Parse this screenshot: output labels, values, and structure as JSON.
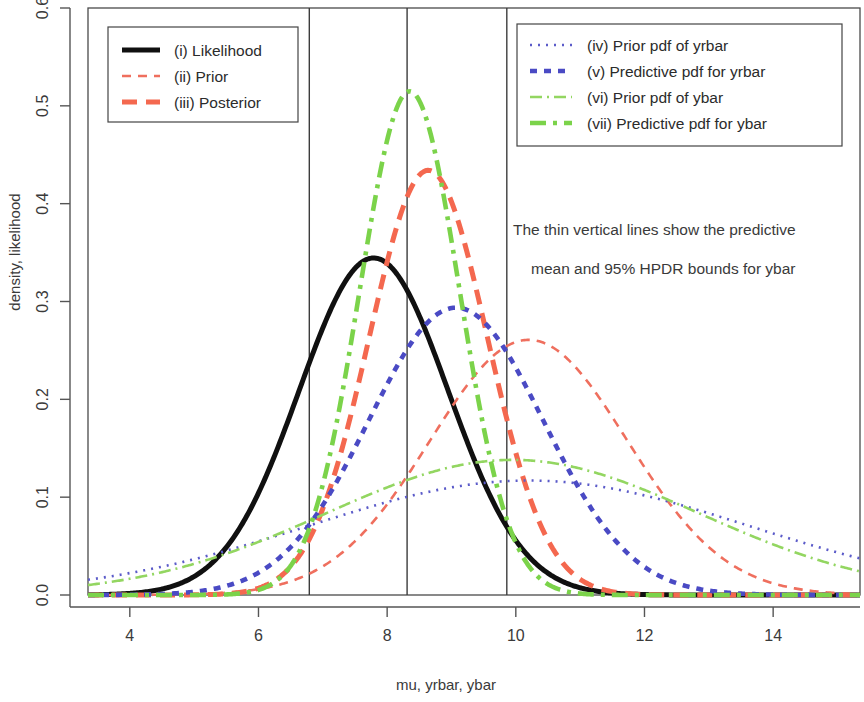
{
  "chart_data": {
    "type": "line",
    "title": "",
    "xlabel": "mu, yrbar, ybar",
    "ylabel": "density, likelihood",
    "xlim": [
      3.35,
      15.35
    ],
    "ylim": [
      0.0,
      0.6
    ],
    "xticks": [
      4,
      6,
      8,
      10,
      12,
      14
    ],
    "xtick_labels": [
      "4",
      "6",
      "8",
      "10",
      "12",
      "14"
    ],
    "yticks": [
      0.0,
      0.1,
      0.2,
      0.3,
      0.4,
      0.5,
      0.6
    ],
    "ytick_labels": [
      "0.0",
      "0.1",
      "0.2",
      "0.3",
      "0.4",
      "0.5",
      "0.6"
    ],
    "grid": false,
    "box": true,
    "annotations": [
      {
        "name": "hpdr-note",
        "lines": [
          "The thin vertical lines show the predictive",
          "mean and 95% HPDR bounds for ybar"
        ],
        "x": 11.6,
        "y": 0.245
      }
    ],
    "vertical_lines": {
      "label": "predictive mean and 95% HPDR bounds for ybar",
      "color": "#3c3c3c",
      "width": 1.4,
      "x_values": [
        6.79,
        8.31,
        9.86
      ]
    },
    "series": [
      {
        "key": "likelihood",
        "legend": "(i) Likelihood",
        "legend_group": "left",
        "color": "#101010",
        "width": 5.0,
        "dash": "none",
        "shape": "normal",
        "mean": 7.79,
        "sd": 1.158,
        "peak": 0.3445,
        "scale": 1.0
      },
      {
        "key": "prior",
        "legend": "(ii) Prior",
        "legend_group": "left",
        "color": "#ef6f5e",
        "width": 2.6,
        "dash": "9,7",
        "shape": "normal",
        "mean": 10.2,
        "sd": 1.53,
        "peak": 0.2608,
        "scale": 1.0
      },
      {
        "key": "posterior",
        "legend": "(iii) Posterior",
        "legend_group": "left",
        "color": "#f4684f",
        "width": 5.0,
        "dash": "15,9",
        "shape": "normal",
        "mean": 8.64,
        "sd": 0.919,
        "peak": 0.4341,
        "scale": 1.0
      },
      {
        "key": "prior-pdf-yrbar",
        "legend": "(iv) Prior pdf of yrbar",
        "legend_group": "right",
        "color": "#5b5bc9",
        "width": 2.6,
        "dash": "2,6",
        "shape": "normal",
        "mean": 10.2,
        "sd": 3.41,
        "peak": 0.117,
        "scale": 1.0
      },
      {
        "key": "predictive-pdf-yrbar",
        "legend": "(v) Predictive pdf for yrbar",
        "legend_group": "right",
        "color": "#4a4ac4",
        "width": 4.6,
        "dash": "7,7",
        "shape": "normal",
        "mean": 9.07,
        "sd": 1.358,
        "peak": 0.2937,
        "scale": 1.0
      },
      {
        "key": "prior-pdf-ybar",
        "legend": "(vi) Prior pdf of ybar",
        "legend_group": "right",
        "color": "#93d661",
        "width": 2.6,
        "dash": "12,5,2,5",
        "shape": "normal",
        "mean": 9.95,
        "sd": 2.89,
        "peak": 0.1381,
        "scale": 1.0
      },
      {
        "key": "predictive-pdf-ybar",
        "legend": "(vii) Predictive pdf for ybar",
        "legend_group": "right",
        "color": "#7bd34a",
        "width": 4.6,
        "dash": "16,7,4,7",
        "shape": "normal",
        "mean": 8.35,
        "sd": 0.775,
        "peak": 0.5148,
        "scale": 1.0
      }
    ]
  },
  "legend_left": {
    "name": "legend-left",
    "items": [
      {
        "label": "(i) Likelihood",
        "series": "likelihood"
      },
      {
        "label": "(ii) Prior",
        "series": "prior"
      },
      {
        "label": "(iii) Posterior",
        "series": "posterior"
      }
    ]
  },
  "legend_right": {
    "name": "legend-right",
    "items": [
      {
        "label": "(iv) Prior pdf of yrbar",
        "series": "prior-pdf-yrbar"
      },
      {
        "label": "(v) Predictive pdf for yrbar",
        "series": "predictive-pdf-yrbar"
      },
      {
        "label": "(vi) Prior pdf of ybar",
        "series": "prior-pdf-ybar"
      },
      {
        "label": "(vii) Predictive pdf for ybar",
        "series": "predictive-pdf-ybar"
      }
    ]
  },
  "annotation": {
    "line1": "The thin vertical lines show the predictive",
    "line2": "mean and 95% HPDR bounds for ybar"
  },
  "axis": {
    "x_label": "mu, yrbar, ybar",
    "y_label": "density, likelihood"
  }
}
